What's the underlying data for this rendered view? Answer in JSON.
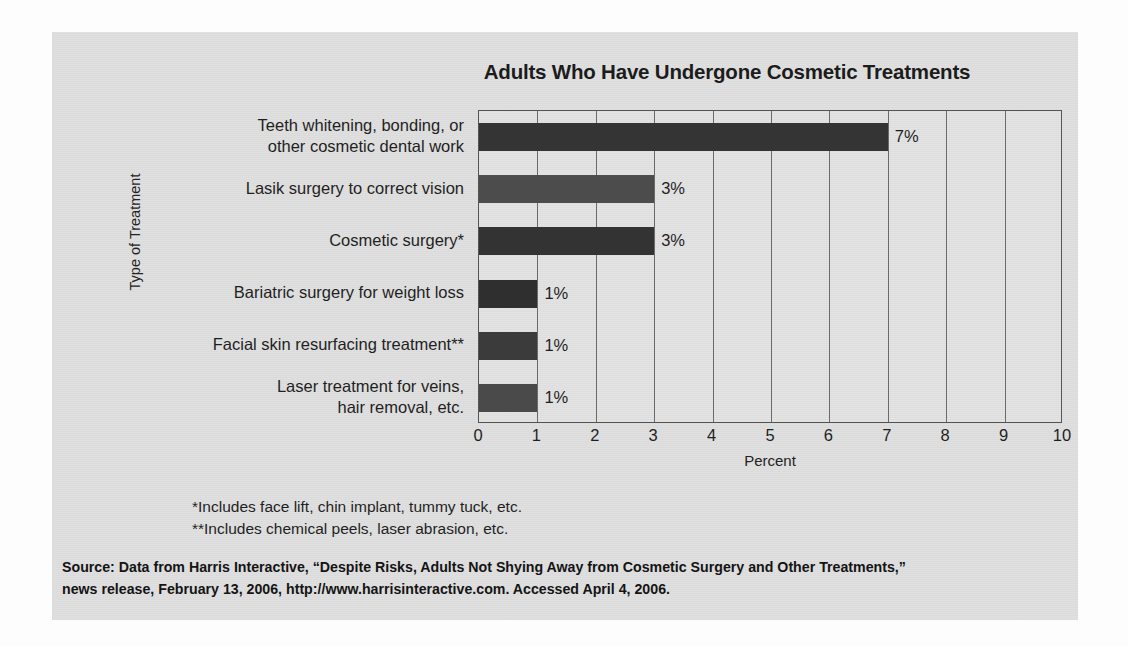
{
  "chart_data": {
    "type": "bar",
    "orientation": "horizontal",
    "title": "Adults Who Have Undergone Cosmetic Treatments",
    "xlabel": "Percent",
    "ylabel": "Type of Treatment",
    "xlim": [
      0,
      10
    ],
    "xticks": [
      "0",
      "1",
      "2",
      "3",
      "4",
      "5",
      "6",
      "7",
      "8",
      "9",
      "10"
    ],
    "grid": true,
    "legend": false,
    "categories": [
      "Teeth whitening, bonding, or other cosmetic dental work",
      "Lasik surgery to correct vision",
      "Cosmetic surgery*",
      "Bariatric surgery for weight loss",
      "Facial skin resurfacing treatment**",
      "Laser treatment for veins, hair removal, etc."
    ],
    "category_lines": [
      [
        "Teeth whitening, bonding, or",
        "other cosmetic dental work"
      ],
      [
        "Lasik surgery to correct vision"
      ],
      [
        "Cosmetic surgery*"
      ],
      [
        "Bariatric surgery for weight loss"
      ],
      [
        "Facial skin resurfacing treatment**"
      ],
      [
        "Laser treatment for veins,",
        "hair removal, etc."
      ]
    ],
    "values": [
      7,
      3,
      3,
      1,
      1,
      1
    ],
    "value_labels": [
      "7%",
      "3%",
      "3%",
      "1%",
      "1%",
      "1%"
    ],
    "bar_colors": [
      "#343434",
      "#4c4c4c",
      "#333333",
      "#2f2f2f",
      "#3b3b3b",
      "#4a4a4a"
    ]
  },
  "footnotes": [
    "*Includes face lift, chin implant, tummy tuck, etc.",
    "**Includes chemical peels, laser abrasion, etc."
  ],
  "source": {
    "lines": [
      "Source: Data from Harris Interactive, “Despite Risks, Adults Not Shying Away from Cosmetic Surgery and Other Treatments,”",
      "news release, February 13, 2006, http://www.harrisinteractive.com. Accessed April 4, 2006."
    ]
  },
  "colors": {
    "card_background": "#dfdfdf",
    "plot_background": "#e2e2e2",
    "axis": "#555555",
    "gridline": "#6a6a6a",
    "text": "#1f1f1f"
  }
}
